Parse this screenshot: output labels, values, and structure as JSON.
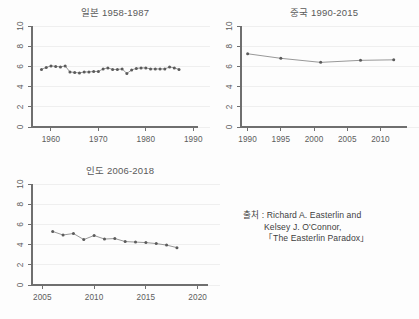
{
  "meta": {
    "background_color": "#fdfdfd",
    "ink_color": "#5b5b5b",
    "grid_color": "#efefef",
    "line_color": "#8c8c8c"
  },
  "source": {
    "label": "출처 : Richard A. Easterlin and",
    "line2": "Kelsey J. O'Connor,",
    "line3": "「The Easterlin Paradox」"
  },
  "chart_data": [
    {
      "id": "japan",
      "type": "line",
      "title": "일본 1958-1987",
      "xlabel": "",
      "ylabel": "",
      "xlim": [
        1956,
        1991
      ],
      "ylim": [
        0,
        10
      ],
      "xticks": [
        1960,
        1970,
        1980,
        1990
      ],
      "yticks": [
        0,
        2,
        4,
        6,
        8,
        10
      ],
      "xtick_labels": [
        "1960",
        "1970",
        "1980",
        "1990"
      ],
      "ytick_labels": [
        "0",
        "2",
        "4",
        "6",
        "8",
        "10"
      ],
      "grid": true,
      "legend": "none",
      "markers": true,
      "x": [
        1958,
        1959,
        1960,
        1961,
        1962,
        1963,
        1964,
        1965,
        1966,
        1967,
        1968,
        1969,
        1970,
        1971,
        1972,
        1973,
        1974,
        1975,
        1976,
        1977,
        1978,
        1979,
        1980,
        1981,
        1982,
        1983,
        1984,
        1985,
        1986,
        1987
      ],
      "values": [
        5.7,
        5.9,
        6.05,
        6.0,
        5.95,
        6.05,
        5.45,
        5.4,
        5.35,
        5.45,
        5.45,
        5.5,
        5.5,
        5.75,
        5.85,
        5.7,
        5.7,
        5.75,
        5.3,
        5.65,
        5.8,
        5.85,
        5.85,
        5.75,
        5.75,
        5.75,
        5.75,
        5.95,
        5.85,
        5.7
      ]
    },
    {
      "id": "china",
      "type": "line",
      "title": "중국 1990-2015",
      "xlabel": "",
      "ylabel": "",
      "xlim": [
        1989,
        2014
      ],
      "ylim": [
        0,
        10
      ],
      "xticks": [
        1990,
        1995,
        2000,
        2005,
        2010
      ],
      "yticks": [
        0,
        2,
        4,
        6,
        8,
        10
      ],
      "xtick_labels": [
        "1990",
        "1995",
        "2000",
        "2005",
        "2010"
      ],
      "ytick_labels": [
        "0",
        "2",
        "4",
        "6",
        "8",
        "10"
      ],
      "grid": true,
      "legend": "none",
      "markers": true,
      "x": [
        1990,
        1995,
        2001,
        2007,
        2012
      ],
      "values": [
        7.25,
        6.8,
        6.4,
        6.6,
        6.65
      ]
    },
    {
      "id": "india",
      "type": "line",
      "title": "인도 2006-2018",
      "xlabel": "",
      "ylabel": "",
      "xlim": [
        2004,
        2021
      ],
      "ylim": [
        0,
        10
      ],
      "xticks": [
        2005,
        2010,
        2015,
        2020
      ],
      "yticks": [
        0,
        2,
        4,
        6,
        8,
        10
      ],
      "xtick_labels": [
        "2005",
        "2010",
        "2015",
        "2020"
      ],
      "ytick_labels": [
        "0",
        "2",
        "4",
        "6",
        "8",
        "10"
      ],
      "grid": true,
      "legend": "none",
      "markers": true,
      "x": [
        2006,
        2007,
        2008,
        2009,
        2010,
        2011,
        2012,
        2013,
        2014,
        2015,
        2016,
        2017,
        2018
      ],
      "values": [
        5.3,
        4.95,
        5.1,
        4.5,
        4.9,
        4.55,
        4.6,
        4.3,
        4.25,
        4.2,
        4.1,
        3.95,
        3.7
      ]
    }
  ]
}
